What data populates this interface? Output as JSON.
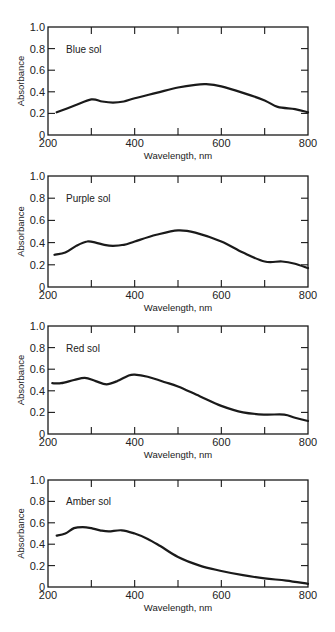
{
  "figure": {
    "panels": [
      {
        "label": "Blue sol",
        "box": {
          "x": 48,
          "y": 27,
          "w": 260,
          "h": 108
        }
      },
      {
        "label": "Purple sol",
        "box": {
          "x": 48,
          "y": 176,
          "w": 260,
          "h": 111
        }
      },
      {
        "label": "Red sol",
        "box": {
          "x": 48,
          "y": 326,
          "w": 260,
          "h": 108
        }
      },
      {
        "label": "Amber sol",
        "box": {
          "x": 48,
          "y": 480,
          "w": 260,
          "h": 107
        }
      }
    ],
    "line_color": "#1a1a1a"
  },
  "chart_data": [
    {
      "type": "line",
      "title": "Blue sol",
      "xlabel": "Wavelength, nm",
      "ylabel": "Absorbance",
      "xlim": [
        200,
        800
      ],
      "ylim": [
        0,
        1.0
      ],
      "xticks": [
        200,
        300,
        400,
        500,
        600,
        700,
        800
      ],
      "xtick_labels": [
        "200",
        "",
        "400",
        "",
        "600",
        "",
        "800"
      ],
      "yticks": [
        0,
        0.2,
        0.4,
        0.6,
        0.8,
        1.0
      ],
      "ytick_labels": [
        "0",
        "0.2",
        "0.4",
        "0.6",
        "0.8",
        "1.0"
      ],
      "grid": false,
      "series": [
        {
          "name": "Blue sol",
          "x": [
            220,
            260,
            300,
            325,
            350,
            375,
            400,
            450,
            500,
            540,
            565,
            600,
            650,
            700,
            730,
            770,
            800
          ],
          "y": [
            0.21,
            0.27,
            0.33,
            0.31,
            0.3,
            0.31,
            0.34,
            0.39,
            0.44,
            0.465,
            0.47,
            0.45,
            0.39,
            0.32,
            0.26,
            0.24,
            0.21
          ]
        }
      ]
    },
    {
      "type": "line",
      "title": "Purple sol",
      "xlabel": "Wavelength, nm",
      "ylabel": "Absorbance",
      "xlim": [
        200,
        800
      ],
      "ylim": [
        0,
        1.0
      ],
      "xticks": [
        200,
        300,
        400,
        500,
        600,
        700,
        800
      ],
      "xtick_labels": [
        "200",
        "",
        "400",
        "",
        "600",
        "",
        "800"
      ],
      "yticks": [
        0,
        0.2,
        0.4,
        0.6,
        0.8,
        1.0
      ],
      "ytick_labels": [
        "0",
        "0.2",
        "0.4",
        "0.6",
        "0.8",
        "1.0"
      ],
      "grid": false,
      "series": [
        {
          "name": "Purple sol",
          "x": [
            215,
            240,
            265,
            290,
            310,
            330,
            350,
            375,
            400,
            450,
            500,
            540,
            600,
            650,
            700,
            740,
            770,
            800
          ],
          "y": [
            0.29,
            0.31,
            0.37,
            0.41,
            0.4,
            0.38,
            0.37,
            0.38,
            0.41,
            0.47,
            0.51,
            0.49,
            0.41,
            0.31,
            0.23,
            0.23,
            0.21,
            0.17
          ]
        }
      ]
    },
    {
      "type": "line",
      "title": "Red sol",
      "xlabel": "Wavelength, nm",
      "ylabel": "Absorbance",
      "xlim": [
        200,
        800
      ],
      "ylim": [
        0,
        1.0
      ],
      "xticks": [
        200,
        300,
        400,
        500,
        600,
        700,
        800
      ],
      "xtick_labels": [
        "200",
        "",
        "400",
        "",
        "600",
        "",
        "800"
      ],
      "yticks": [
        0,
        0.2,
        0.4,
        0.6,
        0.8,
        1.0
      ],
      "ytick_labels": [
        "0",
        "0.2",
        "0.4",
        "0.6",
        "0.8",
        "1.0"
      ],
      "grid": false,
      "series": [
        {
          "name": "Red sol",
          "x": [
            210,
            230,
            260,
            285,
            310,
            335,
            360,
            385,
            400,
            430,
            470,
            500,
            550,
            600,
            650,
            700,
            745,
            770,
            800
          ],
          "y": [
            0.47,
            0.47,
            0.5,
            0.52,
            0.49,
            0.46,
            0.49,
            0.54,
            0.55,
            0.53,
            0.48,
            0.44,
            0.35,
            0.26,
            0.2,
            0.18,
            0.18,
            0.15,
            0.12
          ]
        }
      ]
    },
    {
      "type": "line",
      "title": "Amber sol",
      "xlabel": "Wavelength, nm",
      "ylabel": "Absorbance",
      "xlim": [
        200,
        800
      ],
      "ylim": [
        0,
        1.0
      ],
      "xticks": [
        200,
        300,
        400,
        500,
        600,
        700,
        800
      ],
      "xtick_labels": [
        "200",
        "",
        "400",
        "",
        "600",
        "",
        "800"
      ],
      "yticks": [
        0,
        0.2,
        0.4,
        0.6,
        0.8,
        1.0
      ],
      "ytick_labels": [
        "0",
        "0.2",
        "0.4",
        "0.6",
        "0.8",
        "1.0"
      ],
      "grid": false,
      "series": [
        {
          "name": "Amber sol",
          "x": [
            220,
            240,
            260,
            280,
            300,
            320,
            340,
            370,
            400,
            430,
            460,
            500,
            550,
            600,
            650,
            700,
            750,
            800
          ],
          "y": [
            0.48,
            0.5,
            0.55,
            0.56,
            0.55,
            0.53,
            0.52,
            0.53,
            0.5,
            0.45,
            0.38,
            0.28,
            0.2,
            0.15,
            0.11,
            0.08,
            0.06,
            0.03
          ]
        }
      ]
    }
  ]
}
